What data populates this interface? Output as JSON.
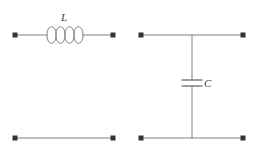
{
  "figure": {
    "type": "circuit-diagram",
    "background_color": "#ffffff",
    "line_color": "#808080",
    "node_color": "#333333",
    "label_color": "#3d3d3d",
    "title": "",
    "caption": ""
  },
  "circuits": [
    {
      "id": "series-inductor",
      "name": "series-inductor-network",
      "component": {
        "symbol": "inductor",
        "label": "L",
        "coil_loops": 4,
        "orientation": "horizontal",
        "connection": "series"
      },
      "terminals": [
        {
          "name": "input-top-left",
          "x": 15,
          "y": 35
        },
        {
          "name": "output-top-right",
          "x": 113,
          "y": 35
        },
        {
          "name": "input-bottom-left",
          "x": 15,
          "y": 138
        },
        {
          "name": "output-bottom-right",
          "x": 113,
          "y": 138
        }
      ],
      "wires": [
        {
          "name": "top-wire-left",
          "x1": 15,
          "y1": 35,
          "x2": 47,
          "y2": 35
        },
        {
          "name": "top-wire-right",
          "x1": 83,
          "y1": 35,
          "x2": 113,
          "y2": 35
        },
        {
          "name": "bottom-wire",
          "x1": 15,
          "y1": 138,
          "x2": 113,
          "y2": 138
        }
      ]
    },
    {
      "id": "shunt-capacitor",
      "name": "shunt-capacitor-network",
      "component": {
        "symbol": "capacitor",
        "label": "C",
        "plates": 2,
        "orientation": "vertical",
        "connection": "shunt"
      },
      "terminals": [
        {
          "name": "input-top-left",
          "x": 141,
          "y": 35
        },
        {
          "name": "output-top-right",
          "x": 243,
          "y": 35
        },
        {
          "name": "input-bottom-left",
          "x": 141,
          "y": 138
        },
        {
          "name": "output-bottom-right",
          "x": 243,
          "y": 138
        }
      ],
      "wires": [
        {
          "name": "top-wire",
          "x1": 141,
          "y1": 35,
          "x2": 243,
          "y2": 35
        },
        {
          "name": "bottom-wire",
          "x1": 141,
          "y1": 138,
          "x2": 243,
          "y2": 138
        },
        {
          "name": "shunt-branch-upper",
          "x1": 192,
          "y1": 35,
          "x2": 192,
          "y2": 80
        },
        {
          "name": "shunt-branch-lower",
          "x1": 192,
          "y1": 86,
          "x2": 192,
          "y2": 138
        }
      ],
      "junctions": [
        {
          "name": "top-junction",
          "x": 192,
          "y": 35
        },
        {
          "name": "bottom-junction",
          "x": 192,
          "y": 138
        }
      ],
      "capacitor_plates": [
        {
          "name": "upper-plate",
          "x1": 182,
          "x2": 202,
          "y": 80
        },
        {
          "name": "lower-plate",
          "x1": 182,
          "x2": 202,
          "y": 86
        }
      ]
    }
  ],
  "labels": {
    "inductor": "L",
    "capacitor": "C"
  }
}
